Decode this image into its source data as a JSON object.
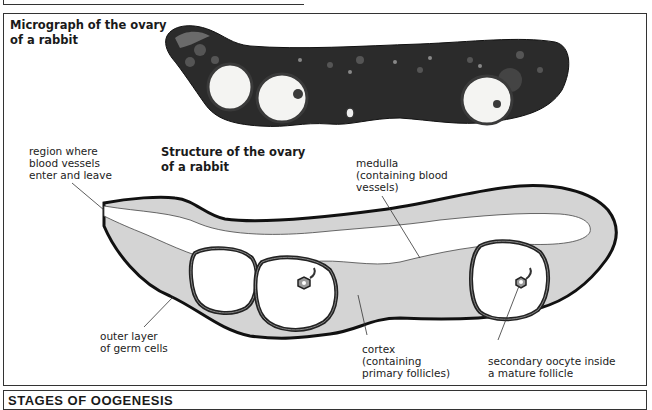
{
  "micrograph": {
    "title_line1": "Micrograph of the ovary",
    "title_line2": "of a rabbit"
  },
  "diagram": {
    "title_line1": "Structure of the ovary",
    "title_line2": "of a rabbit",
    "labels": {
      "region_line1": "region where",
      "region_line2": "blood vessels",
      "region_line3": "enter and leave",
      "medulla_line1": "medulla",
      "medulla_line2": "(containing blood",
      "medulla_line3": "vessels)",
      "outer_line1": "outer layer",
      "outer_line2": "of germ cells",
      "cortex_line1": "cortex",
      "cortex_line2": "(containing",
      "cortex_line3": "primary follicles)",
      "oocyte_line1": "secondary oocyte inside",
      "oocyte_line2": "a mature follicle"
    }
  },
  "stages": {
    "title": "STAGES OF OOGENESIS"
  },
  "colors": {
    "outline": "#111111",
    "cortex_fill": "#d4d4d4",
    "medulla_fill": "#ffffff",
    "micrograph_tissue": "#2a2a2a",
    "frame": "#333333"
  }
}
